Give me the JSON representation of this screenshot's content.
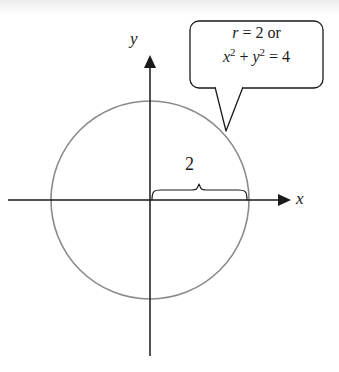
{
  "figure": {
    "name": "polar-circle-graph",
    "background_color": "#ffffff",
    "axis_color": "#1a1a1a",
    "curve_color": "#8a8a8a",
    "text_color": "#1a1a1a"
  },
  "axes": {
    "x_label": "x",
    "y_label": "y",
    "origin": {
      "x": 150,
      "y": 200
    },
    "x_axis": {
      "start_x": 8,
      "end_x": 283,
      "arrow": "right"
    },
    "y_axis": {
      "start_y": 60,
      "end_y": 355,
      "arrow": "up"
    }
  },
  "curve": {
    "type": "circle",
    "center": {
      "x": 0,
      "y": 0
    },
    "radius": 2,
    "pixel_radius": 99,
    "stroke_color": "#8a8a8a"
  },
  "brace": {
    "label": "2",
    "from_x": 0,
    "to_x": 2,
    "orientation": "horizontal-up"
  },
  "callout": {
    "line1": {
      "variable": "r",
      "equals": " = 2 ",
      "conjunction": "or"
    },
    "line2": {
      "x_var": "x",
      "x_exp": "2",
      "plus": " + ",
      "y_var": "y",
      "y_exp": "2",
      "equals": " = 4"
    },
    "plain_text_line1": "r = 2 or",
    "plain_text_line2": "x² + y² = 4",
    "points_to": {
      "x": 225,
      "y": 130
    }
  }
}
